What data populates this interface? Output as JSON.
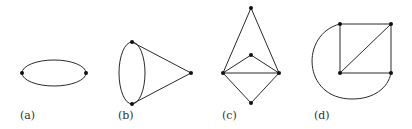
{
  "figure": {
    "panels": [
      {
        "id": "a",
        "label": "(a)",
        "vertices": [
          [
            22,
            73
          ],
          [
            86,
            73
          ]
        ],
        "edges": [
          "two parallel curved edges (multi-edge) forming an ellipse between the two vertices"
        ]
      },
      {
        "id": "b",
        "label": "(b)",
        "vertices": [
          [
            132,
            42
          ],
          [
            132,
            104
          ],
          [
            191,
            73
          ]
        ],
        "edges": [
          "two curved edges between top and bottom vertices (ellipse)",
          "straight edge top-right",
          "straight edge bottom-right"
        ]
      },
      {
        "id": "c",
        "label": "(c)",
        "vertices": [
          [
            251,
            8
          ],
          [
            251,
            55
          ],
          [
            223,
            73
          ],
          [
            279,
            73
          ],
          [
            251,
            103
          ]
        ],
        "edges": [
          "top-left",
          "top-right",
          "middle-left",
          "middle-right",
          "left-right",
          "left-bottom",
          "right-bottom"
        ]
      },
      {
        "id": "d",
        "label": "(d)",
        "vertices": [
          [
            340,
            24
          ],
          [
            391,
            24
          ],
          [
            340,
            73
          ],
          [
            391,
            73
          ]
        ],
        "edges": [
          "top-left to top-right",
          "top-left to bottom-left",
          "top-right to bottom-right",
          "bottom-left to bottom-right",
          "diagonal bottom-left to top-right",
          "curved arc top-left to bottom-right around the left side"
        ]
      }
    ],
    "colors": {
      "stroke": "#2a2a2a",
      "vertex": "#111111",
      "background": "#ffffff",
      "label": "#333333"
    }
  }
}
